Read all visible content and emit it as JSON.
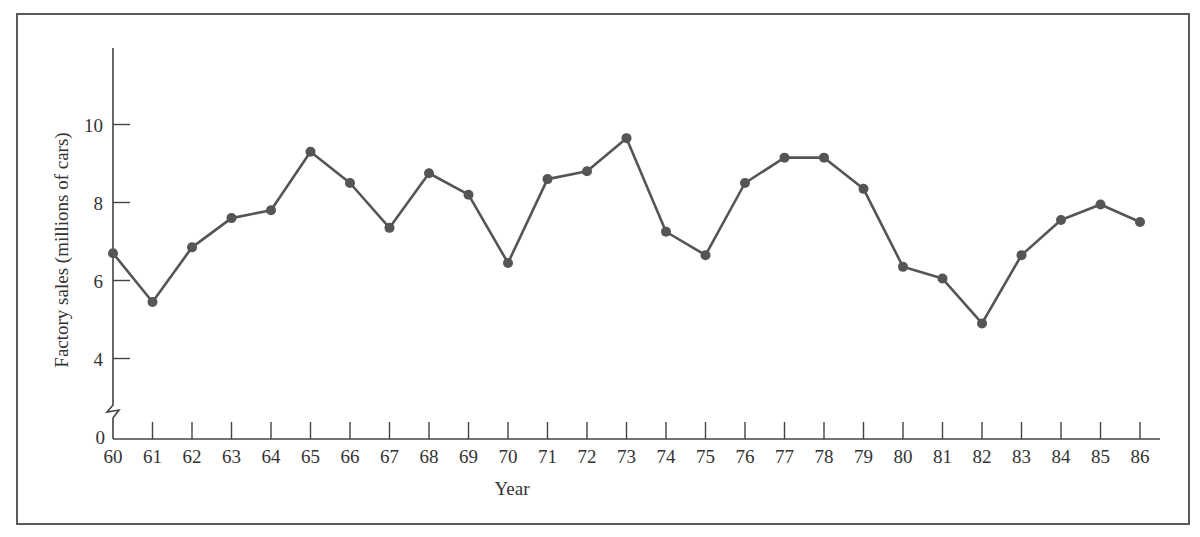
{
  "chart_data": {
    "type": "line",
    "title": "",
    "xlabel": "Year",
    "ylabel": "Factory sales (millions of cars)",
    "x": [
      60,
      61,
      62,
      63,
      64,
      65,
      66,
      67,
      68,
      69,
      70,
      71,
      72,
      73,
      74,
      75,
      76,
      77,
      78,
      79,
      80,
      81,
      82,
      83,
      84,
      85,
      86
    ],
    "x_tick_labels": [
      "60",
      "61",
      "62",
      "63",
      "64",
      "65",
      "66",
      "67",
      "68",
      "69",
      "70",
      "71",
      "72",
      "73",
      "74",
      "75",
      "76",
      "77",
      "78",
      "79",
      "80",
      "81",
      "82",
      "83",
      "84",
      "85",
      "86"
    ],
    "y_tick_values": [
      0,
      4,
      6,
      8,
      10
    ],
    "y_tick_labels": [
      "0",
      "4",
      "6",
      "8",
      "10"
    ],
    "series": [
      {
        "name": "Factory sales",
        "values": [
          6.7,
          5.45,
          6.85,
          7.6,
          7.8,
          9.3,
          8.5,
          7.35,
          8.75,
          8.2,
          6.45,
          8.6,
          8.8,
          9.65,
          7.25,
          6.65,
          8.5,
          9.15,
          9.15,
          8.35,
          6.35,
          6.05,
          4.9,
          6.65,
          7.55,
          7.95,
          7.5
        ]
      }
    ],
    "ylim": [
      0,
      12
    ],
    "y_axis_break": true,
    "grid": false,
    "legend": "none",
    "line_color": "#555555",
    "marker": "circle"
  }
}
